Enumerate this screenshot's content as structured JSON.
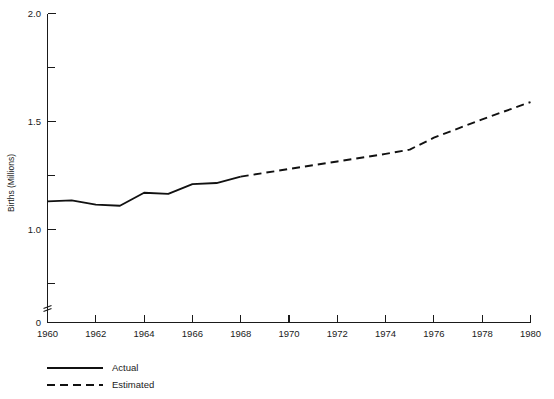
{
  "chart_data": {
    "type": "line",
    "title": "",
    "subtitle": "",
    "xlabel": "",
    "ylabel": "Births (Millions)",
    "xlim": [
      1960,
      1980
    ],
    "ylim": [
      0.6,
      2.0
    ],
    "y_axis_break": true,
    "y_axis_break_note": "axis broken between 0 and 0.6",
    "grid": false,
    "legend_position": "below-left",
    "x_ticks": [
      1960,
      1962,
      1964,
      1966,
      1968,
      1970,
      1972,
      1974,
      1976,
      1978,
      1980
    ],
    "x_tick_labels": [
      "1960",
      "1962",
      "1964",
      "1966",
      "1968",
      "1970",
      "1972",
      "1974",
      "1976",
      "1978",
      "1980"
    ],
    "x_minor_ticks": [
      1961,
      1963,
      1965,
      1967,
      1969,
      1971,
      1973,
      1975,
      1977,
      1979
    ],
    "y_ticks": [
      0,
      1.0,
      1.5,
      2.0
    ],
    "y_tick_labels": [
      "0",
      "1.0",
      "1.5",
      "2.0"
    ],
    "y_minor_ticks": [
      0.75,
      1.25,
      1.75
    ],
    "series": [
      {
        "name": "Actual",
        "style": "solid",
        "color": "#111111",
        "x": [
          1960,
          1961,
          1962,
          1963,
          1964,
          1965,
          1966,
          1967,
          1968
        ],
        "values": [
          1.13,
          1.135,
          1.115,
          1.11,
          1.17,
          1.165,
          1.21,
          1.215,
          1.245
        ]
      },
      {
        "name": "Estimated",
        "style": "dashed",
        "color": "#111111",
        "x": [
          1968,
          1970,
          1972,
          1974,
          1975,
          1976,
          1978,
          1980
        ],
        "values": [
          1.245,
          1.28,
          1.315,
          1.35,
          1.37,
          1.425,
          1.51,
          1.59
        ]
      }
    ],
    "legend": [
      {
        "label": "Actual",
        "style": "solid"
      },
      {
        "label": "Estimated",
        "style": "dashed"
      }
    ]
  },
  "axis": {
    "y_title": "Births (Millions)",
    "y_labels": {
      "t0": "0",
      "t1": "1.0",
      "t2": "1.5",
      "t3": "2.0"
    },
    "x_labels": {
      "t1960": "1960",
      "t1962": "1962",
      "t1964": "1964",
      "t1966": "1966",
      "t1968": "1968",
      "t1970": "1970",
      "t1972": "1972",
      "t1974": "1974",
      "t1976": "1976",
      "t1978": "1978",
      "t1980": "1980"
    }
  },
  "legend": {
    "actual_label": "Actual",
    "estimated_label": "Estimated"
  },
  "colors": {
    "line": "#111111",
    "axis": "#1a1a1a",
    "background": "#ffffff"
  }
}
